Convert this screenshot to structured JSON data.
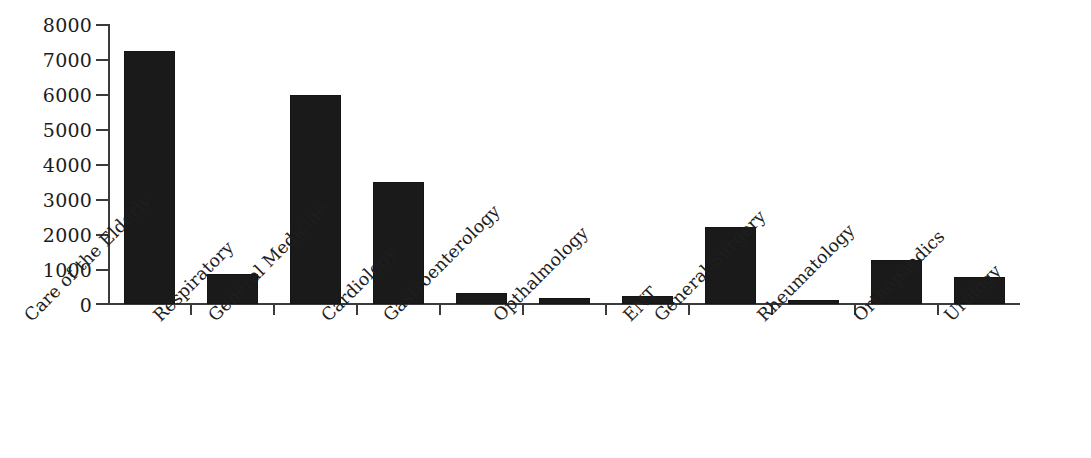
{
  "chart_data": {
    "type": "bar",
    "title": "",
    "subtitle": "",
    "xlabel": "",
    "ylabel": "",
    "ylim": [
      0,
      8000
    ],
    "ytick_step": 1000,
    "yticks": [
      0,
      1000,
      2000,
      3000,
      4000,
      5000,
      6000,
      7000,
      8000
    ],
    "ytick_labels": [
      "0",
      "1000",
      "2000",
      "3000",
      "4000",
      "5000",
      "6000",
      "7000",
      "8000"
    ],
    "grid": false,
    "legend": false,
    "legend_position": "none",
    "xtick_label_rotation": -45,
    "bar_color": "#1a1a1a",
    "axis_color": "#3b3b3b",
    "categories": [
      "Care of the Elderly",
      "Respiratory",
      "General Medicine",
      "Cardiology",
      "Gastroenterology",
      "Opthalmology",
      "ENT",
      "General Surgery",
      "Rheumatology",
      "Orthopaedics",
      "Urology"
    ],
    "values": [
      7250,
      870,
      6000,
      3500,
      330,
      160,
      240,
      2200,
      120,
      1250,
      780
    ]
  }
}
